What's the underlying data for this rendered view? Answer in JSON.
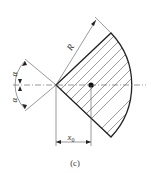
{
  "figure": {
    "caption": "(c)",
    "labels": {
      "radius": "R",
      "angle_upper": "α",
      "angle_lower": "α",
      "centroid_distance": "x",
      "centroid_subscript": "0"
    }
  }
}
